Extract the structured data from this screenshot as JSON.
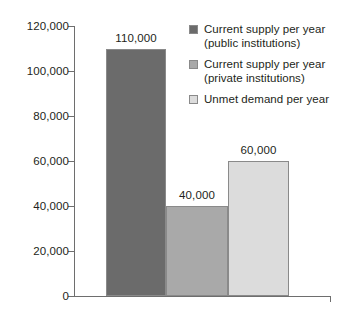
{
  "chart_data": {
    "type": "bar",
    "title": "",
    "subtitle": "",
    "xlabel": "",
    "ylabel": "",
    "ylim": [
      0,
      120000
    ],
    "grid": false,
    "legend_position": "top-right",
    "categories": [
      "Current supply per year (public institutions)",
      "Current supply per year (private institutions)",
      "Unmet demand per year"
    ],
    "values": [
      110000,
      40000,
      60000
    ],
    "value_labels": [
      "110,000",
      "40,000",
      "60,000"
    ],
    "bar_colors": [
      "#6b6b6b",
      "#a9a9a9",
      "#dcdcdc"
    ],
    "y_ticks": [
      0,
      20000,
      40000,
      60000,
      80000,
      100000,
      120000
    ],
    "y_tick_labels": [
      "0",
      "20,000",
      "40,000",
      "60,000",
      "80,000",
      "100,000",
      "120,000"
    ],
    "axis_color": "#6e6e6e",
    "text_color": "#231f20"
  },
  "legend": {
    "items": [
      {
        "label_line1": "Current supply per year",
        "label_line2": "(public institutions)",
        "color": "#6b6b6b",
        "swatch_name": "legend-swatch-public-supply"
      },
      {
        "label_line1": "Current supply per year",
        "label_line2": "(private institutions)",
        "color": "#a9a9a9",
        "swatch_name": "legend-swatch-private-supply"
      },
      {
        "label_line1": "Unmet demand per year",
        "label_line2": "",
        "color": "#dcdcdc",
        "swatch_name": "legend-swatch-unmet-demand"
      }
    ]
  }
}
